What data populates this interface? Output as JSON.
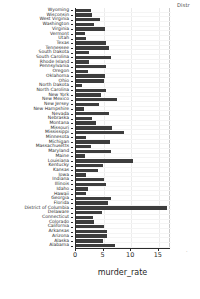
{
  "corner": {
    "truncated_title": "Distr",
    "truncated_mark": "·"
  },
  "axis": {
    "x_label": "murder_rate",
    "x_ticks": [
      0,
      5,
      10,
      15
    ],
    "x_min": 0,
    "x_max": 17.2
  },
  "chart_data": {
    "type": "bar",
    "orientation": "horizontal",
    "title": "Distr",
    "xlabel": "murder_rate",
    "ylabel": "",
    "xlim": [
      0,
      17.2
    ],
    "grid": true,
    "legend": "none",
    "categories": [
      "Wyoming",
      "Wisconsin",
      "West Virginia",
      "Washington",
      "Virginia",
      "Vermont",
      "Utah",
      "Texas",
      "Tennessee",
      "South Dakota",
      "South Carolina",
      "Rhode Island",
      "Pennsylvania",
      "Oregon",
      "Oklahoma",
      "Ohio",
      "North Dakota",
      "North Carolina",
      "New York",
      "New Mexico",
      "New Jersey",
      "New Hampshire",
      "Nevada",
      "Nebraska",
      "Montana",
      "Missouri",
      "Mississippi",
      "Minnesota",
      "Michigan",
      "Massachusetts",
      "Maryland",
      "Maine",
      "Louisiana",
      "Kentucky",
      "Kansas",
      "Iowa",
      "Indiana",
      "Illinois",
      "Idaho",
      "Hawaii",
      "Georgia",
      "Florida",
      "District of Columbia",
      "Delaware",
      "Connecticut",
      "Colorado",
      "California",
      "Arkansas",
      "Arizona",
      "Alaska",
      "Alabama"
    ],
    "values": [
      2.7,
      2.9,
      4.4,
      3.3,
      5.3,
      1.6,
      1.9,
      5.4,
      6.0,
      2.3,
      6.4,
      2.4,
      5.4,
      2.2,
      5.3,
      5.0,
      1.1,
      5.4,
      4.5,
      7.4,
      4.2,
      1.4,
      6.0,
      2.9,
      3.6,
      6.6,
      8.6,
      1.8,
      6.2,
      2.7,
      6.4,
      1.6,
      10.3,
      4.8,
      4.0,
      1.9,
      5.0,
      5.5,
      2.1,
      1.8,
      6.3,
      5.8,
      16.5,
      4.7,
      3.0,
      3.2,
      5.0,
      5.6,
      5.6,
      4.8,
      7.1
    ]
  }
}
